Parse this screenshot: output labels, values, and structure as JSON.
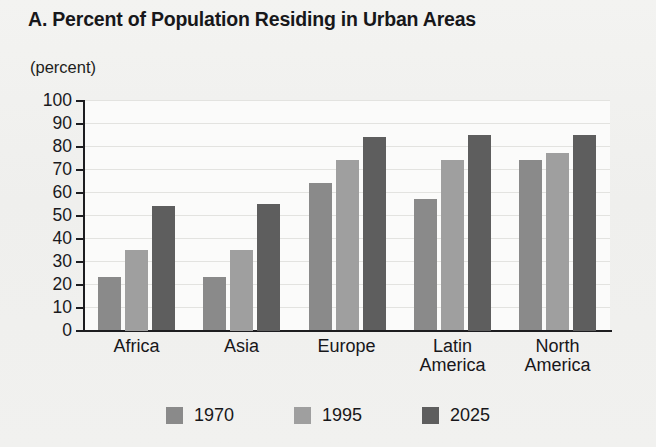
{
  "chart_data": {
    "type": "bar",
    "title": "A. Percent of Population Residing in Urban Areas",
    "subtitle": "(percent)",
    "ylabel": "(percent)",
    "xlabel": "",
    "ylim": [
      0,
      100
    ],
    "ytick_step": 10,
    "yticks": [
      "100",
      "90",
      "80",
      "70",
      "60",
      "50",
      "40",
      "30",
      "20",
      "10",
      "0"
    ],
    "grid": true,
    "legend_position": "bottom",
    "categories": [
      "Africa",
      "Asia",
      "Europe",
      "Latin America",
      "North America"
    ],
    "category_lines": [
      [
        "Africa"
      ],
      [
        "Asia"
      ],
      [
        "Europe"
      ],
      [
        "Latin",
        "America"
      ],
      [
        "North",
        "America"
      ]
    ],
    "series": [
      {
        "name": "1970",
        "color": "#8a8a8a",
        "values": [
          23,
          23,
          64,
          57,
          74
        ]
      },
      {
        "name": "1995",
        "color": "#9f9f9f",
        "values": [
          35,
          35,
          74,
          74,
          77
        ]
      },
      {
        "name": "2025",
        "color": "#5e5e5e",
        "values": [
          54,
          55,
          84,
          85,
          85
        ]
      }
    ]
  },
  "colors": {
    "page_background": "#f2f2f0",
    "plot_background": "#fbfbfa",
    "axis": "#1d1d20",
    "gridline": "#e3e3e0",
    "text": "#17171a"
  }
}
